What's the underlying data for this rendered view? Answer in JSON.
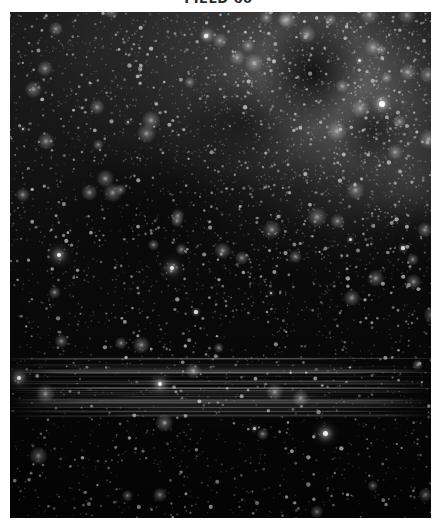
{
  "figure": {
    "title": "FIELD 60",
    "title_clipped": true,
    "caption": "",
    "colormap": "grayscale",
    "background_color": "#ffffff",
    "sky_color": "#050505",
    "star_color": "#ffffff"
  },
  "panel": {
    "name": "sky-image-panel",
    "x": 10,
    "y": 12,
    "width": 421,
    "height": 506,
    "description": "Grayscale wide-field astronomical star field image"
  },
  "chart_data": {
    "type": "heatmap",
    "title": "FIELD 60",
    "xlabel": "",
    "ylabel": "",
    "colormap": "gray",
    "grid": false,
    "legend": "none",
    "xlim": [
      0,
      421
    ],
    "ylim": [
      0,
      506
    ],
    "features": [
      {
        "name": "diffuse-nebulosity",
        "region": "upper-right",
        "center_x": 337,
        "center_y": 81,
        "peak_brightness": 0.62
      },
      {
        "name": "dust-lane",
        "region": "upper-right",
        "center_x": 303,
        "center_y": 61,
        "peak_brightness": 0.05
      },
      {
        "name": "readout-streaks",
        "region": "lower-middle",
        "y_start": 343,
        "y_end": 405,
        "peak_brightness": 0.24
      }
    ],
    "bright_sources": [
      {
        "id": 1,
        "x": 372,
        "y": 92,
        "radius": 6.0,
        "brightness": 1.0
      },
      {
        "id": 2,
        "x": 49,
        "y": 243,
        "radius": 4.5,
        "brightness": 0.95
      },
      {
        "id": 3,
        "x": 162,
        "y": 256,
        "radius": 4.0,
        "brightness": 0.92
      },
      {
        "id": 4,
        "x": 186,
        "y": 300,
        "radius": 3.2,
        "brightness": 0.85
      },
      {
        "id": 5,
        "x": 9,
        "y": 366,
        "radius": 4.2,
        "brightness": 0.93
      },
      {
        "id": 6,
        "x": 150,
        "y": 372,
        "radius": 4.4,
        "brightness": 0.96
      },
      {
        "id": 7,
        "x": 315,
        "y": 421,
        "radius": 5.0,
        "brightness": 0.98
      },
      {
        "id": 8,
        "x": 244,
        "y": 416,
        "radius": 3.0,
        "brightness": 0.8
      },
      {
        "id": 9,
        "x": 196,
        "y": 24,
        "radius": 3.4,
        "brightness": 0.86
      },
      {
        "id": 10,
        "x": 349,
        "y": 48,
        "radius": 3.0,
        "brightness": 0.82
      },
      {
        "id": 11,
        "x": 118,
        "y": 110,
        "radius": 2.6,
        "brightness": 0.74
      },
      {
        "id": 12,
        "x": 393,
        "y": 236,
        "radius": 3.2,
        "brightness": 0.84
      },
      {
        "id": 13,
        "x": 261,
        "y": 281,
        "radius": 2.8,
        "brightness": 0.78
      },
      {
        "id": 14,
        "x": 13,
        "y": 117,
        "radius": 2.8,
        "brightness": 0.78
      },
      {
        "id": 15,
        "x": 340,
        "y": 227,
        "radius": 3.0,
        "brightness": 0.8
      }
    ],
    "star_count_estimate": 2600
  }
}
